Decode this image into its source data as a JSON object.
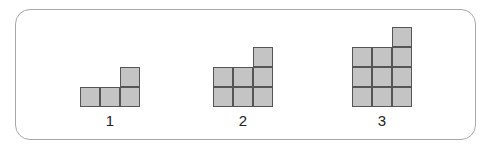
{
  "figures": [
    {
      "label": "1",
      "left": 80,
      "bottom": 107,
      "columns": [
        1,
        1,
        2
      ]
    },
    {
      "label": "2",
      "left": 213,
      "bottom": 107,
      "columns": [
        2,
        2,
        3
      ]
    },
    {
      "label": "3",
      "left": 352,
      "bottom": 107,
      "columns": [
        3,
        3,
        4
      ]
    }
  ],
  "colors": {
    "cell_fill": "#c4c4c4",
    "cell_border": "#555555",
    "frame_border": "#a8a8a8"
  }
}
